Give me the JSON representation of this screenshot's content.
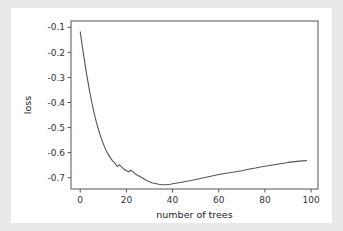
{
  "figure": {
    "background_color": "#ffffff",
    "page_background_color": "#e9e9e9",
    "axes_color": "#555555",
    "line_color": "#555555"
  },
  "chart_data": {
    "type": "line",
    "title": "",
    "xlabel": "number of trees",
    "ylabel": "loss",
    "xlim": [
      -4,
      103
    ],
    "ylim": [
      -0.745,
      -0.075
    ],
    "grid": false,
    "legend": null,
    "xticks": [
      0,
      20,
      40,
      60,
      80,
      100
    ],
    "xticklabels": [
      "0",
      "20",
      "40",
      "60",
      "80",
      "100"
    ],
    "yticks": [
      -0.1,
      -0.2,
      -0.3,
      -0.4,
      -0.5,
      -0.6,
      -0.7
    ],
    "yticklabels": [
      "-0.1",
      "-0.2",
      "-0.3",
      "-0.4",
      "-0.5",
      "-0.6",
      "-0.7"
    ],
    "series": [
      {
        "name": "loss",
        "x": [
          0,
          1,
          2,
          3,
          4,
          5,
          6,
          7,
          8,
          9,
          10,
          11,
          12,
          13,
          14,
          15,
          16,
          17,
          18,
          19,
          20,
          21,
          22,
          23,
          24,
          25,
          26,
          27,
          28,
          29,
          30,
          31,
          32,
          33,
          34,
          35,
          36,
          37,
          38,
          39,
          40,
          42,
          44,
          46,
          48,
          50,
          52,
          54,
          56,
          58,
          60,
          62,
          64,
          66,
          68,
          70,
          72,
          74,
          76,
          78,
          80,
          82,
          84,
          86,
          88,
          90,
          92,
          94,
          96,
          98
        ],
        "y": [
          -0.118,
          -0.182,
          -0.243,
          -0.3,
          -0.352,
          -0.399,
          -0.441,
          -0.478,
          -0.511,
          -0.54,
          -0.565,
          -0.587,
          -0.605,
          -0.62,
          -0.633,
          -0.641,
          -0.655,
          -0.649,
          -0.658,
          -0.666,
          -0.672,
          -0.676,
          -0.67,
          -0.678,
          -0.686,
          -0.691,
          -0.696,
          -0.701,
          -0.707,
          -0.712,
          -0.716,
          -0.72,
          -0.722,
          -0.724,
          -0.726,
          -0.727,
          -0.728,
          -0.728,
          -0.727,
          -0.726,
          -0.724,
          -0.721,
          -0.718,
          -0.714,
          -0.711,
          -0.707,
          -0.703,
          -0.699,
          -0.695,
          -0.691,
          -0.687,
          -0.684,
          -0.681,
          -0.678,
          -0.675,
          -0.672,
          -0.668,
          -0.664,
          -0.661,
          -0.657,
          -0.654,
          -0.651,
          -0.648,
          -0.645,
          -0.642,
          -0.639,
          -0.637,
          -0.635,
          -0.633,
          -0.632
        ]
      }
    ]
  }
}
